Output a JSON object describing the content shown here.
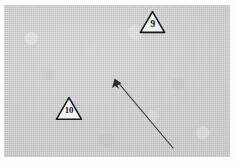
{
  "scene": {
    "title": "Grayscale scene with numbered triangular markers and a direction arrow",
    "canvas": {
      "width": 235,
      "height": 167
    },
    "page_background": "#ffffff",
    "plate": {
      "name": "photo-plate",
      "background": "#cdcdcd",
      "x": 4,
      "y": 5,
      "width": 226,
      "height": 152
    }
  },
  "markers": [
    {
      "id": "marker-9",
      "label": "9",
      "shape": "triangle",
      "fill": "#f2f2f2",
      "stroke": "#1a1a1a",
      "x": 139,
      "y": 10,
      "width": 27,
      "height": 24,
      "font_size": 10
    },
    {
      "id": "marker-10",
      "label": "10",
      "shape": "triangle",
      "fill": "#f2f2f2",
      "stroke": "#1a1a1a",
      "x": 55,
      "y": 96,
      "width": 28,
      "height": 25,
      "font_size": 9
    }
  ],
  "arrow": {
    "id": "direction-arrow",
    "color": "#3a3a3a",
    "stroke_width": 1.2,
    "tail_x": 173,
    "tail_y": 148,
    "head_x": 115,
    "head_y": 79,
    "head_size": 7
  }
}
